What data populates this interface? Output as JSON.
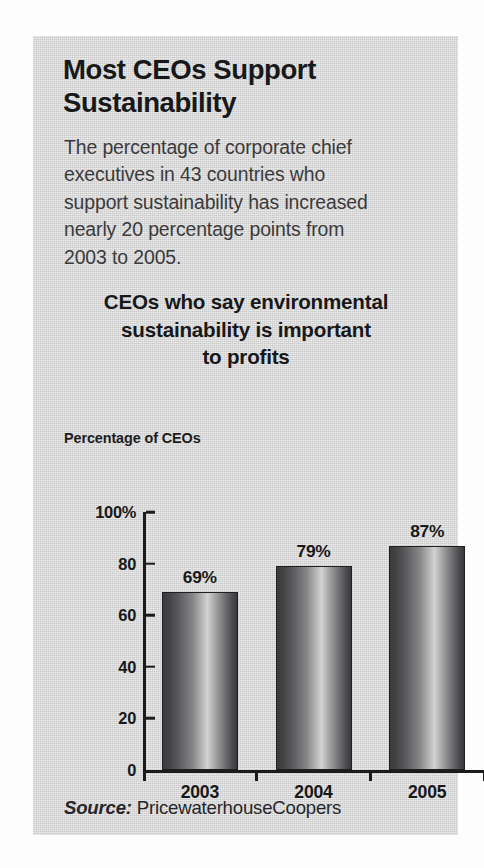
{
  "headline": {
    "line1": "Most CEOs Support",
    "line2": "Sustainability"
  },
  "deck": {
    "line1": "The percentage of corporate chief",
    "line2": "executives in 43 countries who",
    "line3": "support sustainability has increased",
    "line4": "nearly 20 percentage points from",
    "line5": "2003 to 2005."
  },
  "source": {
    "label": "Source:",
    "text": " PricewaterhouseCoopers"
  },
  "colors": {
    "card_background": "#d8d8d8",
    "text": "#18181a",
    "deck_text": "#3a3a3c",
    "axis": "#1b1b1d",
    "bar_dark": "#39393b",
    "bar_light": "#d2d2d2"
  },
  "chart_data": {
    "type": "bar",
    "title": "CEOs who say environmental sustainability is important to profits",
    "title_line1": "CEOs who say environmental",
    "title_line2": "sustainability is important",
    "title_line3": "to profits",
    "ylabel": "Percentage of CEOs",
    "xlabel": "",
    "categories": [
      "2003",
      "2004",
      "2005"
    ],
    "values": [
      69,
      79,
      87
    ],
    "data_labels": [
      "69%",
      "79%",
      "87%"
    ],
    "ylim": [
      0,
      100
    ],
    "yticks": [
      100,
      80,
      60,
      40,
      20,
      0
    ],
    "ytick_labels": [
      "100%",
      "80",
      "60",
      "40",
      "20",
      "0"
    ],
    "grid": false,
    "legend": false
  }
}
